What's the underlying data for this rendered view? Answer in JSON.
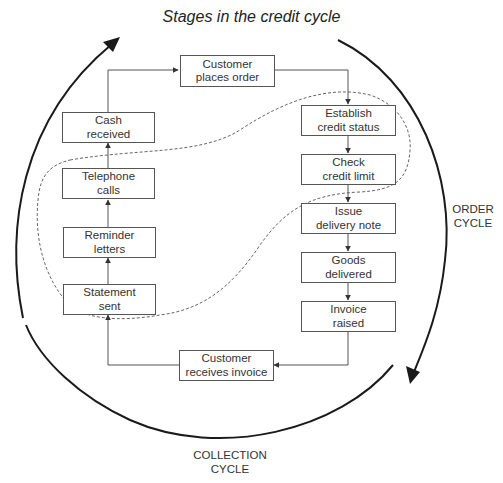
{
  "title": "Stages in the credit cycle",
  "cycles": {
    "order": {
      "line1": "ORDER",
      "line2": "CYCLE"
    },
    "collection": {
      "line1": "COLLECTION",
      "line2": "CYCLE"
    }
  },
  "stages": [
    {
      "id": "customer-places-order",
      "line1": "Customer",
      "line2": "places order"
    },
    {
      "id": "establish-credit-status",
      "line1": "Establish",
      "line2": "credit status"
    },
    {
      "id": "check-credit-limit",
      "line1": "Check",
      "line2": "credit limit"
    },
    {
      "id": "issue-delivery-note",
      "line1": "Issue",
      "line2": "delivery note"
    },
    {
      "id": "goods-delivered",
      "line1": "Goods",
      "line2": "delivered"
    },
    {
      "id": "invoice-raised",
      "line1": "Invoice",
      "line2": "raised"
    },
    {
      "id": "customer-receives-invoice",
      "line1": "Customer",
      "line2": "receives invoice"
    },
    {
      "id": "statement-sent",
      "line1": "Statement",
      "line2": "sent"
    },
    {
      "id": "reminder-letters",
      "line1": "Reminder",
      "line2": "letters"
    },
    {
      "id": "telephone-calls",
      "line1": "Telephone",
      "line2": "calls"
    },
    {
      "id": "cash-received",
      "line1": "Cash",
      "line2": "received"
    }
  ],
  "colors": {
    "box_border": "#555555",
    "connector": "#555555",
    "cycle_arc": "#1a1a1a",
    "dashed_boundary": "#666666",
    "text": "#333333"
  }
}
